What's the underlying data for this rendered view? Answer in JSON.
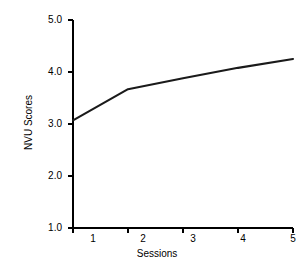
{
  "chart_data": {
    "type": "line",
    "title": "",
    "xlabel": "Sessions",
    "ylabel": "NVU Scores",
    "x": [
      1,
      2,
      3,
      4,
      5
    ],
    "categories": [
      "1",
      "2",
      "3",
      "4",
      "5"
    ],
    "values": [
      3.07,
      3.67,
      3.88,
      4.08,
      4.25
    ],
    "series": [
      {
        "name": "NVU Scores",
        "values": [
          3.07,
          3.67,
          3.88,
          4.08,
          4.25
        ]
      }
    ],
    "xlim": [
      1,
      5
    ],
    "ylim": [
      1.0,
      5.0
    ],
    "xticks": [
      "1",
      "2",
      "3",
      "4",
      "5"
    ],
    "yticks": [
      "5.0",
      "4.0",
      "3.0",
      "2.0",
      "1.0"
    ],
    "grid": false,
    "legend": false,
    "line_color": "#1a1a1a",
    "axis_color": "#000000",
    "background_color": "#ffffff"
  },
  "axes": {
    "y": {
      "title": "NVU Scores",
      "ticks": [
        {
          "label": "5.0",
          "value": 5.0
        },
        {
          "label": "4.0",
          "value": 4.0
        },
        {
          "label": "3.0",
          "value": 3.0
        },
        {
          "label": "2.0",
          "value": 2.0
        },
        {
          "label": "1.0",
          "value": 1.0
        }
      ]
    },
    "x": {
      "title": "Sessions",
      "ticks": [
        {
          "label": "1",
          "value": 1
        },
        {
          "label": "2",
          "value": 2
        },
        {
          "label": "3",
          "value": 3
        },
        {
          "label": "4",
          "value": 4
        },
        {
          "label": "5",
          "value": 5
        }
      ]
    }
  }
}
